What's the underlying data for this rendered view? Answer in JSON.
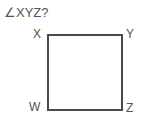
{
  "figure": {
    "question": "∠XYZ?",
    "shape_type": "square",
    "stroke_color": "#4a4a4a",
    "stroke_width": 2,
    "background_color": "#ffffff",
    "text_color": "#555555",
    "square": {
      "left": 48,
      "top": 35,
      "right": 122,
      "bottom": 110,
      "width": 74,
      "height": 75
    },
    "vertices": [
      {
        "label": "X",
        "position": "top-left"
      },
      {
        "label": "Y",
        "position": "top-right"
      },
      {
        "label": "W",
        "position": "bottom-left"
      },
      {
        "label": "Z",
        "position": "bottom-right"
      }
    ]
  }
}
